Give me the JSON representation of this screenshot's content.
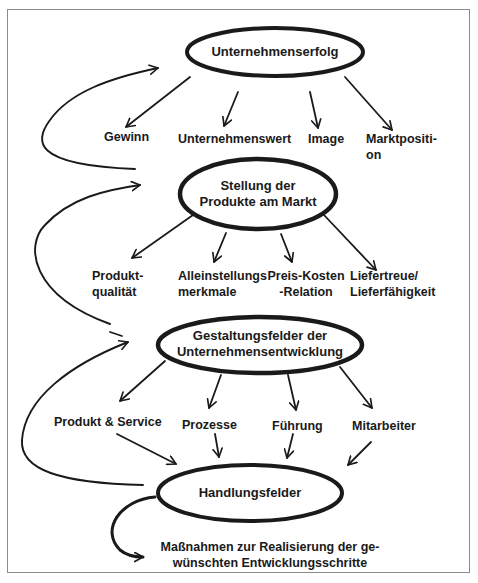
{
  "diagram": {
    "type": "hierarchy-flow",
    "colors": {
      "ink": "#1a1a1a",
      "frame": "#8a8a8a",
      "background": "#ffffff"
    },
    "levels": [
      {
        "node": {
          "label": "Unternehmenserfolg"
        },
        "children": [
          "Gewinn",
          "Unternehmenswert",
          "Image",
          "Marktpositi-\non"
        ]
      },
      {
        "node": {
          "label_line1": "Stellung der",
          "label_line2": "Produkte am Markt"
        },
        "children": [
          "Produkt-\nqualität",
          "Alleinstellungs\nmerkmale",
          "Preis-Kosten\n-Relation",
          "Liefertreue/\nLieferfähigkeit"
        ]
      },
      {
        "node": {
          "label_line1": "Gestaltungsfelder der",
          "label_line2": "Unternehmensentwicklung"
        },
        "children": [
          "Produkt & Service",
          "Prozesse",
          "Führung",
          "Mitarbeiter"
        ]
      },
      {
        "node": {
          "label": "Handlungsfelder"
        },
        "outcome_line1": "Maßnahmen zur Realisierung der ge-",
        "outcome_line2": "wünschten Entwicklungsschritte"
      }
    ],
    "labels": {
      "l1": {
        "gewinn": "Gewinn",
        "unternehmenswert": "Unternehmenswert",
        "image": "Image",
        "marktposition_1": "Marktpositi-",
        "marktposition_2": "on"
      },
      "l2": {
        "produktqualitaet_1": "Produkt-",
        "produktqualitaet_2": "qualität",
        "alleinstellung_1": "Alleinstellungs",
        "alleinstellung_2": "merkmale",
        "preiskosten_1": "Preis-Kosten",
        "preiskosten_2": "-Relation",
        "liefertreue_1": "Liefertreue/",
        "liefertreue_2": "Lieferfähigkeit"
      },
      "l3": {
        "produkt_service": "Produkt & Service",
        "prozesse": "Prozesse",
        "fuehrung": "Führung",
        "mitarbeiter": "Mitarbeiter"
      }
    },
    "feedback_loops": [
      "Stellung der Produkte am Markt -> Unternehmenserfolg",
      "Gestaltungsfelder der Unternehmensentwicklung -> Stellung der Produkte am Markt",
      "Handlungsfelder -> Gestaltungsfelder der Unternehmensentwicklung",
      "Handlungsfelder -> Maßnahmen zur Realisierung"
    ]
  }
}
